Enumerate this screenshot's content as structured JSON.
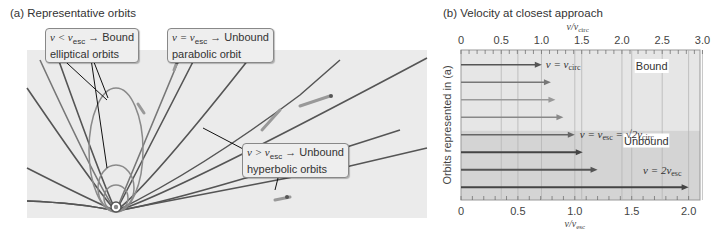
{
  "panel_a": {
    "title": "(a) Representative orbits",
    "callouts": {
      "bound": {
        "condition": "v < v",
        "sub": "esc",
        "arrow": "→",
        "result": "Bound",
        "line2": "elliptical orbits"
      },
      "parabolic": {
        "condition": "v = v",
        "sub": "esc",
        "arrow": "→",
        "result": "Unbound",
        "line2": "parabolic orbit"
      },
      "hyperbolic": {
        "condition": "v > v",
        "sub": "esc",
        "arrow": "→",
        "result": "Unbound",
        "line2": "hyperbolic orbits"
      }
    }
  },
  "panel_b": {
    "title": "(b) Velocity at closest approach",
    "top_axis_label": "v/v",
    "top_axis_sub": "circ",
    "bottom_axis_label": "v/v",
    "bottom_axis_sub": "esc",
    "y_axis_label": "Orbits represented in (a)",
    "region_labels": {
      "bound": "Bound",
      "unbound": "Unbound"
    },
    "annotations": {
      "circ": {
        "text": "v = v",
        "sub": "circ"
      },
      "esc": {
        "text": "v = v",
        "sub": "esc",
        "extra": " = √2v",
        "extra_sub": "circ"
      },
      "double": {
        "text": "v = 2v",
        "sub": "esc"
      }
    }
  },
  "colors": {
    "panel_bg": "#ebebeb",
    "bound_bg": "#e6e6e6",
    "unbound_bg": "#d4d4d4",
    "orbit_dark": "#555555",
    "orbit_light": "#8a8a8a",
    "grid": "#b5b5b5"
  },
  "chart_data": {
    "type": "bar",
    "title": "(b) Velocity at closest approach",
    "orientation": "horizontal",
    "xlabel": "v/v_esc",
    "x2label": "v/v_circ",
    "ylabel": "Orbits represented in (a)",
    "xlim": [
      0,
      2.1
    ],
    "x2lim": [
      0,
      3.0
    ],
    "x_ticks": [
      0,
      0.5,
      1.0,
      1.5,
      2.0
    ],
    "x2_ticks": [
      0,
      0.5,
      1.0,
      1.5,
      2.0,
      2.5,
      3.0
    ],
    "categories": [
      "orbit 1",
      "orbit 2",
      "orbit 3",
      "orbit 4",
      "orbit 5",
      "orbit 6",
      "orbit 7",
      "orbit 8"
    ],
    "values": [
      0.71,
      0.79,
      0.83,
      0.9,
      1.0,
      1.07,
      1.2,
      2.0
    ],
    "regions": [
      {
        "label": "Bound",
        "range_v_over_vesc": [
          0,
          1.0
        ]
      },
      {
        "label": "Unbound",
        "range_v_over_vesc": [
          1.0,
          2.1
        ]
      }
    ],
    "annotations": [
      "v = v_circ",
      "v = v_esc = √2 v_circ",
      "v = 2 v_esc"
    ],
    "grid": true
  }
}
